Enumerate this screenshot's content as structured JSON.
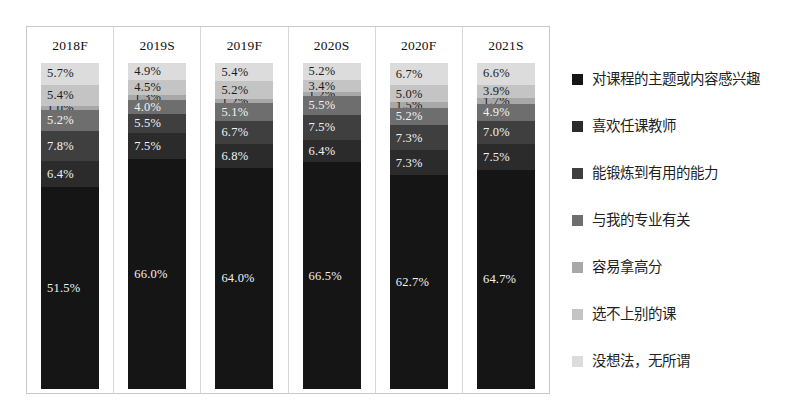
{
  "chart_data": {
    "type": "bar",
    "title": "",
    "subtitle": "",
    "xlabel": "",
    "ylabel": "",
    "stacked": true,
    "normalized_percent": true,
    "grid": false,
    "legend_position": "right",
    "ylim": [
      0,
      100
    ],
    "categories": [
      "2018F",
      "2019S",
      "2019F",
      "2020S",
      "2020F",
      "2021S"
    ],
    "series": [
      {
        "name": "对课程的主题或内容感兴趣",
        "color": "#151515",
        "values": [
          51.5,
          66.0,
          64.0,
          66.5,
          62.7,
          64.7
        ],
        "labels": [
          "51.5%",
          "66.0%",
          "64.0%",
          "66.5%",
          "62.7%",
          "64.7%"
        ]
      },
      {
        "name": "喜欢任课教师",
        "color": "#2b2b2b",
        "values": [
          6.4,
          7.5,
          6.8,
          6.4,
          7.3,
          7.5
        ],
        "labels": [
          "6.4%",
          "7.5%",
          "6.8%",
          "6.4%",
          "7.3%",
          "7.5%"
        ]
      },
      {
        "name": "能锻炼到有用的能力",
        "color": "#3f3f3f",
        "values": [
          7.8,
          5.5,
          6.7,
          7.5,
          7.3,
          7.0
        ],
        "labels": [
          "7.8%",
          "5.5%",
          "6.7%",
          "7.5%",
          "7.3%",
          "7.0%"
        ]
      },
      {
        "name": "与我的专业有关",
        "color": "#6e6e6e",
        "values": [
          5.2,
          4.0,
          5.1,
          5.5,
          5.2,
          4.9
        ],
        "labels": [
          "5.2%",
          "4.0%",
          "5.1%",
          "5.5%",
          "5.2%",
          "4.9%"
        ]
      },
      {
        "name": "容易拿高分",
        "color": "#a8a8a8",
        "values": [
          1.0,
          1.3,
          1.2,
          1.2,
          1.5,
          1.7
        ],
        "labels": [
          "1.0%",
          "1.3%",
          "1.2%",
          "1.2%",
          "1.5%",
          "1.7%"
        ]
      },
      {
        "name": "选不上别的课",
        "color": "#c4c4c4",
        "values": [
          5.4,
          4.5,
          5.2,
          3.4,
          5.0,
          3.9
        ],
        "labels": [
          "5.4%",
          "4.5%",
          "5.2%",
          "3.4%",
          "5.0%",
          "3.9%"
        ]
      },
      {
        "name": "没想法，无所谓",
        "color": "#dcdcdc",
        "values": [
          5.7,
          4.9,
          5.4,
          5.2,
          6.7,
          6.6
        ],
        "labels": [
          "5.7%",
          "4.9%",
          "5.4%",
          "5.2%",
          "6.7%",
          "6.6%"
        ]
      }
    ]
  },
  "columns": [
    {
      "label": "2018F",
      "segments": [
        {
          "label": "5.7%",
          "value": 5.7,
          "series": "没想法，无所谓",
          "color": "#dcdcdc",
          "text_color": "#1b1b1b"
        },
        {
          "label": "5.4%",
          "value": 5.4,
          "series": "选不上别的课",
          "color": "#c4c4c4",
          "text_color": "#1b1b1b"
        },
        {
          "label": "1.0%",
          "value": 1.0,
          "series": "容易拿高分",
          "color": "#a8a8a8",
          "text_color": "#1b1b1b"
        },
        {
          "label": "5.2%",
          "value": 5.2,
          "series": "与我的专业有关",
          "color": "#6e6e6e",
          "text_color": "#f2f2f2"
        },
        {
          "label": "7.8%",
          "value": 7.8,
          "series": "能锻炼到有用的能力",
          "color": "#3f3f3f",
          "text_color": "#f2f2f2"
        },
        {
          "label": "6.4%",
          "value": 6.4,
          "series": "喜欢任课教师",
          "color": "#2b2b2b",
          "text_color": "#f2f2f2"
        },
        {
          "label": "51.5%",
          "value": 51.5,
          "series": "对课程的主题或内容感兴趣",
          "color": "#151515",
          "text_color": "#f2f2f2"
        }
      ]
    },
    {
      "label": "2019S",
      "segments": [
        {
          "label": "4.9%",
          "value": 4.9,
          "series": "没想法，无所谓",
          "color": "#dcdcdc",
          "text_color": "#1b1b1b"
        },
        {
          "label": "4.5%",
          "value": 4.5,
          "series": "选不上别的课",
          "color": "#c4c4c4",
          "text_color": "#1b1b1b"
        },
        {
          "label": "1.3%",
          "value": 1.3,
          "series": "容易拿高分",
          "color": "#a8a8a8",
          "text_color": "#1b1b1b"
        },
        {
          "label": "4.0%",
          "value": 4.0,
          "series": "与我的专业有关",
          "color": "#6e6e6e",
          "text_color": "#f2f2f2"
        },
        {
          "label": "5.5%",
          "value": 5.5,
          "series": "能锻炼到有用的能力",
          "color": "#3f3f3f",
          "text_color": "#f2f2f2"
        },
        {
          "label": "7.5%",
          "value": 7.5,
          "series": "喜欢任课教师",
          "color": "#2b2b2b",
          "text_color": "#f2f2f2"
        },
        {
          "label": "66.0%",
          "value": 66.0,
          "series": "对课程的主题或内容感兴趣",
          "color": "#151515",
          "text_color": "#f2f2f2"
        }
      ]
    },
    {
      "label": "2019F",
      "segments": [
        {
          "label": "5.4%",
          "value": 5.4,
          "series": "没想法，无所谓",
          "color": "#dcdcdc",
          "text_color": "#1b1b1b"
        },
        {
          "label": "5.2%",
          "value": 5.2,
          "series": "选不上别的课",
          "color": "#c4c4c4",
          "text_color": "#1b1b1b"
        },
        {
          "label": "1.2%",
          "value": 1.2,
          "series": "容易拿高分",
          "color": "#a8a8a8",
          "text_color": "#1b1b1b"
        },
        {
          "label": "5.1%",
          "value": 5.1,
          "series": "与我的专业有关",
          "color": "#6e6e6e",
          "text_color": "#f2f2f2"
        },
        {
          "label": "6.7%",
          "value": 6.7,
          "series": "能锻炼到有用的能力",
          "color": "#3f3f3f",
          "text_color": "#f2f2f2"
        },
        {
          "label": "6.8%",
          "value": 6.8,
          "series": "喜欢任课教师",
          "color": "#2b2b2b",
          "text_color": "#f2f2f2"
        },
        {
          "label": "64.0%",
          "value": 64.0,
          "series": "对课程的主题或内容感兴趣",
          "color": "#151515",
          "text_color": "#f2f2f2"
        }
      ]
    },
    {
      "label": "2020S",
      "segments": [
        {
          "label": "5.2%",
          "value": 5.2,
          "series": "没想法，无所谓",
          "color": "#dcdcdc",
          "text_color": "#1b1b1b"
        },
        {
          "label": "3.4%",
          "value": 3.4,
          "series": "选不上别的课",
          "color": "#c4c4c4",
          "text_color": "#1b1b1b"
        },
        {
          "label": "1.2%",
          "value": 1.2,
          "series": "容易拿高分",
          "color": "#a8a8a8",
          "text_color": "#1b1b1b"
        },
        {
          "label": "5.5%",
          "value": 5.5,
          "series": "与我的专业有关",
          "color": "#6e6e6e",
          "text_color": "#f2f2f2"
        },
        {
          "label": "7.5%",
          "value": 7.5,
          "series": "能锻炼到有用的能力",
          "color": "#3f3f3f",
          "text_color": "#f2f2f2"
        },
        {
          "label": "6.4%",
          "value": 6.4,
          "series": "喜欢任课教师",
          "color": "#2b2b2b",
          "text_color": "#f2f2f2"
        },
        {
          "label": "66.5%",
          "value": 66.5,
          "series": "对课程的主题或内容感兴趣",
          "color": "#151515",
          "text_color": "#f2f2f2"
        }
      ]
    },
    {
      "label": "2020F",
      "segments": [
        {
          "label": "6.7%",
          "value": 6.7,
          "series": "没想法，无所谓",
          "color": "#dcdcdc",
          "text_color": "#1b1b1b"
        },
        {
          "label": "5.0%",
          "value": 5.0,
          "series": "选不上别的课",
          "color": "#c4c4c4",
          "text_color": "#1b1b1b"
        },
        {
          "label": "1.5%",
          "value": 1.5,
          "series": "容易拿高分",
          "color": "#a8a8a8",
          "text_color": "#1b1b1b"
        },
        {
          "label": "5.2%",
          "value": 5.2,
          "series": "与我的专业有关",
          "color": "#6e6e6e",
          "text_color": "#f2f2f2"
        },
        {
          "label": "7.3%",
          "value": 7.3,
          "series": "能锻炼到有用的能力",
          "color": "#3f3f3f",
          "text_color": "#f2f2f2"
        },
        {
          "label": "7.3%",
          "value": 7.3,
          "series": "喜欢任课教师",
          "color": "#2b2b2b",
          "text_color": "#f2f2f2"
        },
        {
          "label": "62.7%",
          "value": 62.7,
          "series": "对课程的主题或内容感兴趣",
          "color": "#151515",
          "text_color": "#f2f2f2"
        }
      ]
    },
    {
      "label": "2021S",
      "segments": [
        {
          "label": "6.6%",
          "value": 6.6,
          "series": "没想法，无所谓",
          "color": "#dcdcdc",
          "text_color": "#1b1b1b"
        },
        {
          "label": "3.9%",
          "value": 3.9,
          "series": "选不上别的课",
          "color": "#c4c4c4",
          "text_color": "#1b1b1b"
        },
        {
          "label": "1.7%",
          "value": 1.7,
          "series": "容易拿高分",
          "color": "#a8a8a8",
          "text_color": "#1b1b1b"
        },
        {
          "label": "4.9%",
          "value": 4.9,
          "series": "与我的专业有关",
          "color": "#6e6e6e",
          "text_color": "#f2f2f2"
        },
        {
          "label": "7.0%",
          "value": 7.0,
          "series": "能锻炼到有用的能力",
          "color": "#3f3f3f",
          "text_color": "#f2f2f2"
        },
        {
          "label": "7.5%",
          "value": 7.5,
          "series": "喜欢任课教师",
          "color": "#2b2b2b",
          "text_color": "#f2f2f2"
        },
        {
          "label": "64.7%",
          "value": 64.7,
          "series": "对课程的主题或内容感兴趣",
          "color": "#151515",
          "text_color": "#f2f2f2"
        }
      ]
    }
  ],
  "legend": {
    "items": [
      {
        "label": "对课程的主题或内容感兴趣",
        "color": "#151515"
      },
      {
        "label": "喜欢任课教师",
        "color": "#2b2b2b"
      },
      {
        "label": "能锻炼到有用的能力",
        "color": "#3f3f3f"
      },
      {
        "label": "与我的专业有关",
        "color": "#6e6e6e"
      },
      {
        "label": "容易拿高分",
        "color": "#a8a8a8"
      },
      {
        "label": "选不上别的课",
        "color": "#c4c4c4"
      },
      {
        "label": "没想法，无所谓",
        "color": "#dcdcdc"
      }
    ]
  }
}
